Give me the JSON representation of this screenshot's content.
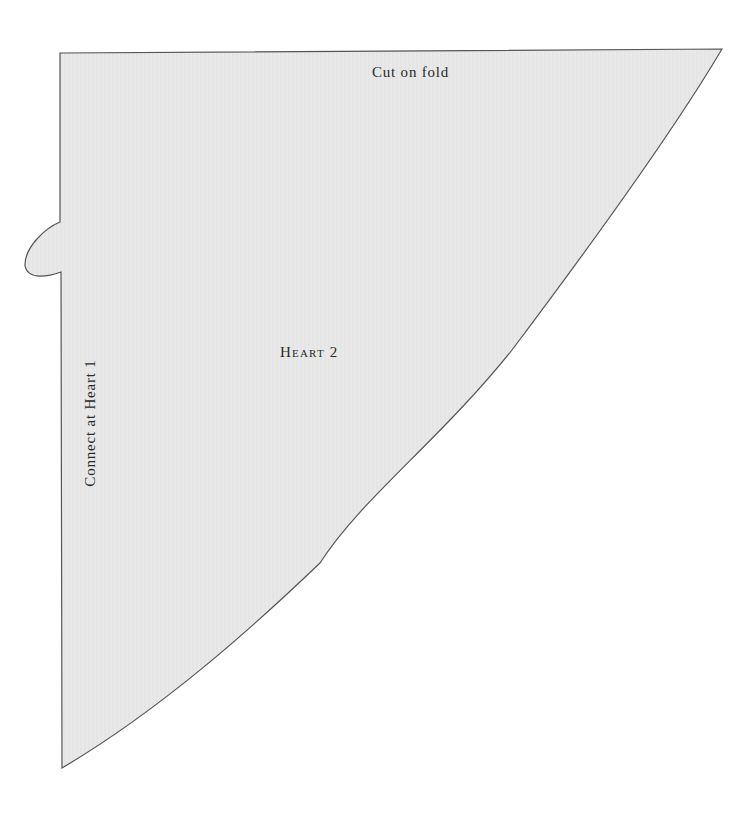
{
  "pattern": {
    "fold_label": "Cut on fold",
    "piece_label": "Heart 2",
    "connect_label": "Connect at Heart 1",
    "colors": {
      "fill": "#e8e8e8",
      "stroke": "#555555",
      "background": "#ffffff",
      "text": "#2a2a2a"
    }
  }
}
